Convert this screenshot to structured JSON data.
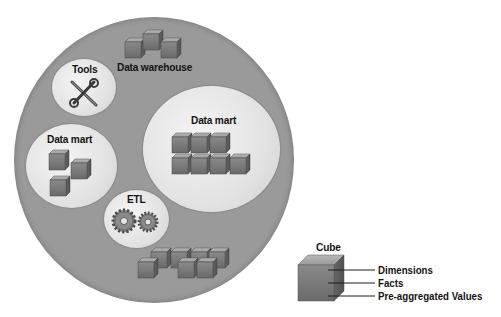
{
  "diagram": {
    "container": {
      "label": "Data warehouse"
    },
    "components": [
      {
        "id": "tools",
        "label": "Tools",
        "icon": "wrench-screwdriver-icon"
      },
      {
        "id": "data-mart-left",
        "label": "Data mart",
        "icon": "cubes-icon",
        "cube_count": 3
      },
      {
        "id": "data-mart-right",
        "label": "Data mart",
        "icon": "cubes-icon",
        "cube_count": 7
      },
      {
        "id": "etl",
        "label": "ETL",
        "icon": "gears-icon"
      }
    ],
    "bottom_cubes": {
      "cube_count": 6
    }
  },
  "legend": {
    "title": "Cube",
    "items": [
      {
        "label": "Dimensions"
      },
      {
        "label": "Facts"
      },
      {
        "label": "Pre-aggregated Values"
      }
    ]
  },
  "colors": {
    "outer_circle": "#9a9a9a",
    "inner_circle": "#e6e6e6",
    "cube_front": "#7a7a7a",
    "cube_top": "#a8a8a8",
    "cube_side": "#5e5e5e",
    "text": "#141414"
  }
}
